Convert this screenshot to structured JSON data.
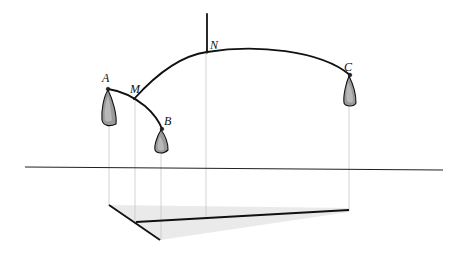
{
  "figure": {
    "labels": {
      "A": "A",
      "B": "B",
      "C": "C",
      "M": "M",
      "N": "N"
    },
    "colors": {
      "ink": "#111111",
      "weight_fill": "#9a9a9a",
      "projection_line": "#c8c8c8",
      "floor_shade": "#e4e4e4"
    }
  }
}
